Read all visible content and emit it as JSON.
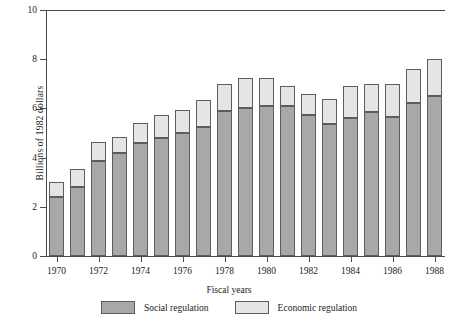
{
  "chart_data": {
    "type": "bar",
    "subtype": "stacked-vertical",
    "title": "",
    "xlabel": "Fiscal years",
    "ylabel": "Billions of 1982 dollars",
    "ylim": [
      0,
      10
    ],
    "ytick_values": [
      0,
      2,
      4,
      6,
      8,
      10
    ],
    "ytick_labels": [
      "0",
      "2",
      "4",
      "6",
      "8",
      "10"
    ],
    "grid": false,
    "legend_position": "bottom",
    "categories": [
      "1970",
      "1971",
      "1972",
      "1973",
      "1974",
      "1975",
      "1976",
      "1977",
      "1978",
      "1979",
      "1980",
      "1981",
      "1982",
      "1983",
      "1984",
      "1985",
      "1986",
      "1987",
      "1988"
    ],
    "xtick_labels": [
      "1970",
      "1972",
      "1974",
      "1976",
      "1978",
      "1980",
      "1982",
      "1984",
      "1986",
      "1988"
    ],
    "series": [
      {
        "name": "Social regulation",
        "color": "#a8a8a8",
        "values": [
          2.4,
          2.8,
          3.85,
          4.2,
          4.6,
          4.8,
          5.0,
          5.25,
          5.9,
          6.0,
          6.1,
          6.1,
          5.75,
          5.35,
          5.6,
          5.85,
          5.65,
          6.2,
          6.5
        ]
      },
      {
        "name": "Economic regulation",
        "color": "#e5e5e5",
        "values": [
          0.6,
          0.75,
          0.8,
          0.65,
          0.8,
          0.95,
          0.95,
          1.1,
          1.1,
          1.25,
          1.15,
          0.8,
          0.85,
          1.05,
          1.3,
          1.15,
          1.35,
          1.4,
          1.5
        ]
      }
    ],
    "totals": [
      3.0,
      3.55,
      4.65,
      4.85,
      5.4,
      5.75,
      5.95,
      6.35,
      7.0,
      7.25,
      7.25,
      6.9,
      6.6,
      6.4,
      6.9,
      7.0,
      7.0,
      7.6,
      8.0
    ]
  },
  "legend": {
    "items": [
      {
        "label": "Social regulation",
        "color": "#a8a8a8"
      },
      {
        "label": "Economic regulation",
        "color": "#e5e5e5"
      }
    ]
  },
  "axes": {
    "y_title": "Billions of 1982 dollars",
    "x_title": "Fiscal years"
  }
}
